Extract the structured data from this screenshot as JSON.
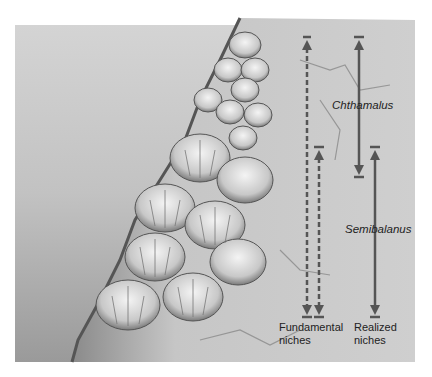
{
  "figure": {
    "colors": {
      "water": "#c9c9c9",
      "rock": "#b8b8b8",
      "arrow": "#555555",
      "text": "#222222",
      "background": "#ffffff"
    }
  },
  "species": {
    "chthamalus": "Chthamalus",
    "semibalanus": "Semibalanus"
  },
  "labels": {
    "fundamental_line1": "Fundamental",
    "fundamental_line2": "niches",
    "realized_line1": "Realized",
    "realized_line2": "niches"
  },
  "arrows": {
    "fundamental_chthamalus": {
      "style": "dashed",
      "top": 37,
      "bottom": 316
    },
    "fundamental_semibalanus": {
      "style": "dashed",
      "top": 147,
      "bottom": 316
    },
    "realized_chthamalus": {
      "style": "solid",
      "top": 37,
      "bottom": 177
    },
    "realized_semibalanus": {
      "style": "solid",
      "top": 147,
      "bottom": 316
    }
  }
}
